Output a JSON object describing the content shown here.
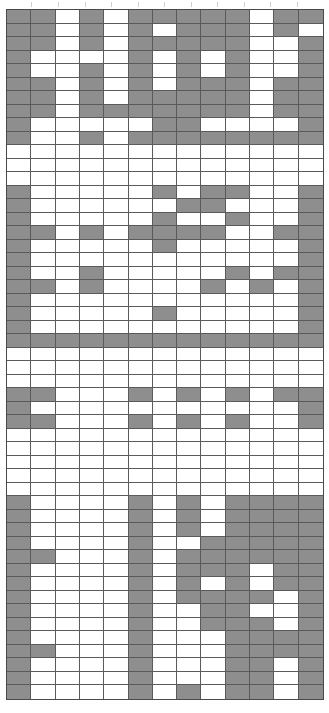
{
  "figure": {
    "kind": "binary-grid-matrix",
    "background_color": "#ffffff",
    "filled_color": "#8e8e8e",
    "empty_color": "#ffffff",
    "gridline_color": "#5a5a5a",
    "border_color": "#4a4a4a",
    "tick_color": "#cfcfcf",
    "columns": 12,
    "rows": 51,
    "tick_count": 11,
    "tick_x_positions": [
      31,
      58,
      85,
      111,
      138,
      164,
      191,
      217,
      244,
      270,
      297
    ]
  },
  "chart_data": {
    "type": "heatmap",
    "title": "",
    "subtitle": "",
    "xlabel": "",
    "ylabel": "",
    "grid": true,
    "legend": "none",
    "value_scale": "binary",
    "value_labels": {
      "0": "empty",
      "1": "filled"
    },
    "categories": [
      "C1",
      "C2",
      "C3",
      "C4",
      "C5",
      "C6",
      "C7",
      "C8",
      "C9",
      "C10",
      "C11",
      "C12"
    ],
    "row_labels": [
      "R1",
      "R2",
      "R3",
      "R4",
      "R5",
      "R6",
      "R7",
      "R8",
      "R9",
      "R10",
      "R11",
      "R12",
      "R13",
      "R14",
      "R15",
      "R16",
      "R17",
      "R18",
      "R19",
      "R20",
      "R21",
      "R22",
      "R23",
      "R24",
      "R25",
      "R26",
      "R27",
      "R28",
      "R29",
      "R30",
      "R31",
      "R32",
      "R33",
      "R34",
      "R35",
      "R36",
      "R37",
      "R38",
      "R39",
      "R40",
      "R41",
      "R42",
      "R43",
      "R44",
      "R45",
      "R46",
      "R47",
      "R48",
      "R49",
      "R50",
      "R51"
    ],
    "matrix": [
      [
        1,
        1,
        0,
        1,
        0,
        1,
        1,
        1,
        1,
        1,
        0,
        1,
        1
      ],
      [
        1,
        1,
        0,
        1,
        0,
        1,
        0,
        1,
        1,
        1,
        0,
        1,
        0
      ],
      [
        1,
        1,
        0,
        1,
        0,
        1,
        1,
        1,
        1,
        1,
        0,
        0,
        1
      ],
      [
        1,
        0,
        0,
        0,
        0,
        1,
        0,
        1,
        0,
        1,
        0,
        0,
        1
      ],
      [
        1,
        0,
        0,
        1,
        0,
        1,
        0,
        1,
        0,
        1,
        0,
        0,
        1
      ],
      [
        1,
        1,
        0,
        1,
        0,
        1,
        0,
        1,
        1,
        1,
        0,
        1,
        1
      ],
      [
        1,
        1,
        0,
        1,
        0,
        1,
        1,
        1,
        1,
        1,
        0,
        1,
        1
      ],
      [
        1,
        1,
        0,
        1,
        1,
        1,
        1,
        1,
        1,
        1,
        0,
        1,
        1
      ],
      [
        1,
        0,
        0,
        0,
        0,
        0,
        1,
        1,
        0,
        0,
        0,
        0,
        1
      ],
      [
        1,
        0,
        0,
        1,
        0,
        1,
        1,
        1,
        1,
        1,
        1,
        1,
        1
      ],
      [
        0,
        0,
        0,
        0,
        0,
        0,
        0,
        0,
        0,
        0,
        0,
        0,
        0
      ],
      [
        0,
        0,
        0,
        0,
        0,
        0,
        0,
        0,
        0,
        0,
        0,
        0,
        0
      ],
      [
        0,
        0,
        0,
        0,
        0,
        0,
        0,
        0,
        0,
        0,
        0,
        0,
        0
      ],
      [
        1,
        0,
        0,
        0,
        0,
        0,
        1,
        0,
        1,
        1,
        0,
        0,
        1
      ],
      [
        1,
        0,
        0,
        0,
        0,
        0,
        0,
        1,
        1,
        0,
        0,
        0,
        1
      ],
      [
        1,
        0,
        0,
        0,
        0,
        0,
        1,
        0,
        0,
        1,
        0,
        0,
        1
      ],
      [
        1,
        1,
        0,
        1,
        0,
        1,
        1,
        1,
        1,
        0,
        0,
        1,
        1
      ],
      [
        1,
        0,
        0,
        0,
        0,
        0,
        1,
        0,
        0,
        0,
        0,
        0,
        1
      ],
      [
        1,
        0,
        0,
        0,
        0,
        0,
        0,
        0,
        0,
        0,
        0,
        0,
        1
      ],
      [
        1,
        0,
        0,
        1,
        0,
        0,
        0,
        0,
        0,
        1,
        0,
        1,
        1
      ],
      [
        1,
        1,
        0,
        1,
        0,
        0,
        0,
        0,
        1,
        0,
        1,
        0,
        1
      ],
      [
        1,
        0,
        0,
        0,
        0,
        0,
        0,
        0,
        0,
        0,
        0,
        0,
        1
      ],
      [
        1,
        0,
        0,
        0,
        0,
        0,
        1,
        0,
        0,
        0,
        0,
        0,
        1
      ],
      [
        1,
        0,
        0,
        0,
        0,
        0,
        0,
        0,
        0,
        0,
        0,
        0,
        1
      ],
      [
        1,
        1,
        1,
        1,
        1,
        1,
        1,
        1,
        1,
        1,
        1,
        1,
        1
      ],
      [
        0,
        0,
        0,
        0,
        0,
        0,
        0,
        0,
        0,
        0,
        0,
        0,
        0
      ],
      [
        0,
        0,
        0,
        0,
        0,
        0,
        0,
        0,
        0,
        0,
        0,
        0,
        0
      ],
      [
        0,
        0,
        0,
        0,
        0,
        0,
        0,
        0,
        0,
        0,
        0,
        0,
        0
      ],
      [
        1,
        1,
        0,
        0,
        0,
        1,
        0,
        1,
        0,
        1,
        0,
        1,
        1
      ],
      [
        1,
        0,
        0,
        0,
        0,
        0,
        0,
        0,
        0,
        0,
        0,
        0,
        1
      ],
      [
        1,
        1,
        0,
        0,
        0,
        1,
        0,
        1,
        0,
        1,
        0,
        0,
        1
      ],
      [
        0,
        0,
        0,
        0,
        0,
        0,
        0,
        0,
        0,
        0,
        0,
        0,
        0
      ],
      [
        0,
        0,
        0,
        0,
        0,
        0,
        0,
        0,
        0,
        0,
        0,
        0,
        0
      ],
      [
        0,
        0,
        0,
        0,
        0,
        0,
        0,
        0,
        0,
        0,
        0,
        0,
        0
      ],
      [
        0,
        0,
        0,
        0,
        0,
        0,
        0,
        0,
        0,
        0,
        0,
        0,
        0
      ],
      [
        0,
        0,
        0,
        0,
        0,
        0,
        0,
        0,
        0,
        0,
        0,
        0,
        0
      ],
      [
        1,
        0,
        0,
        0,
        0,
        1,
        0,
        1,
        0,
        1,
        1,
        1,
        1
      ],
      [
        1,
        0,
        0,
        0,
        0,
        1,
        0,
        1,
        0,
        1,
        1,
        1,
        1
      ],
      [
        1,
        0,
        0,
        0,
        0,
        1,
        0,
        1,
        0,
        1,
        1,
        1,
        1
      ],
      [
        1,
        0,
        0,
        0,
        0,
        1,
        0,
        0,
        1,
        1,
        1,
        1,
        1
      ],
      [
        1,
        1,
        0,
        0,
        0,
        1,
        0,
        1,
        1,
        1,
        1,
        1,
        1
      ],
      [
        1,
        0,
        0,
        0,
        0,
        1,
        0,
        1,
        1,
        1,
        0,
        1,
        1
      ],
      [
        1,
        0,
        0,
        0,
        0,
        1,
        0,
        1,
        0,
        1,
        0,
        1,
        1
      ],
      [
        1,
        0,
        0,
        0,
        0,
        1,
        0,
        1,
        1,
        1,
        1,
        0,
        1
      ],
      [
        1,
        0,
        0,
        0,
        0,
        1,
        0,
        0,
        1,
        1,
        0,
        0,
        1
      ],
      [
        1,
        0,
        0,
        0,
        0,
        1,
        0,
        0,
        1,
        1,
        1,
        0,
        1
      ],
      [
        1,
        0,
        0,
        0,
        0,
        1,
        0,
        0,
        0,
        1,
        1,
        1,
        1
      ],
      [
        1,
        1,
        0,
        0,
        0,
        1,
        0,
        0,
        0,
        1,
        1,
        1,
        1
      ],
      [
        1,
        0,
        0,
        0,
        0,
        1,
        0,
        0,
        0,
        1,
        1,
        0,
        1
      ],
      [
        1,
        0,
        0,
        0,
        0,
        1,
        0,
        0,
        0,
        1,
        1,
        0,
        1
      ],
      [
        1,
        0,
        0,
        0,
        0,
        1,
        0,
        1,
        0,
        1,
        1,
        0,
        1
      ]
    ]
  }
}
